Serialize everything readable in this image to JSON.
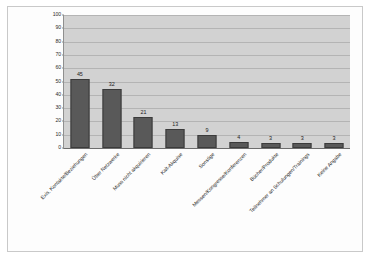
{
  "chart_data": {
    "type": "bar",
    "title": "",
    "subtitle": "",
    "xlabel": "",
    "ylabel": "",
    "ylim": [
      0,
      100
    ],
    "yticks": [
      0,
      10,
      20,
      30,
      40,
      50,
      60,
      70,
      80,
      90,
      100
    ],
    "grid": true,
    "legend": false,
    "legend_position": "none",
    "orientation": "vertical",
    "bar_color": "#595959",
    "plot_background": "#d2d2d2",
    "categories": [
      "Exis. Kontakte/Beziehungen",
      "Über Netzwerke",
      "Muss nicht akquirieren",
      "Kalt-Akquise",
      "Sonstige",
      "Messen/Kongresse/Konferenzen",
      "Bücher/Produkte",
      "Teilnehmer an Schulungen/Trainings",
      "Keine Angabe"
    ],
    "values": [
      45,
      32,
      21,
      13,
      9,
      4,
      3,
      3,
      3
    ],
    "bar_pixel_heights": [
      69,
      59,
      31,
      19,
      13,
      6,
      5,
      5,
      5
    ],
    "data_labels": [
      "45",
      "32",
      "21",
      "13",
      "9",
      "4",
      "3",
      "3",
      "3"
    ]
  },
  "axis": {
    "y_tick_labels": [
      "100",
      "90",
      "80",
      "70",
      "60",
      "50",
      "40",
      "30",
      "20",
      "10",
      "0"
    ]
  }
}
